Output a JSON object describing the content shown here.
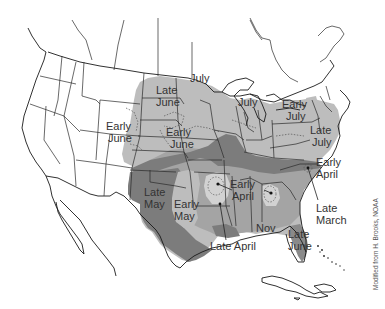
{
  "map": {
    "title": "",
    "region": "Continental United States",
    "credit": "Modified from H. Brooks, NOAA",
    "shading_colors": {
      "light": "#bdbdbd",
      "medium": "#a4a4a4",
      "dark": "#7c7c7c",
      "lightest": "#d8d8d8",
      "land": "#ffffff",
      "outline": "#1a1a1a"
    },
    "labels": [
      {
        "id": "late-june-north",
        "line1": "Late",
        "line2": "June"
      },
      {
        "id": "july-north",
        "line1": "July",
        "line2": ""
      },
      {
        "id": "early-june-west",
        "line1": "Early",
        "line2": "June"
      },
      {
        "id": "early-june-central",
        "line1": "Early",
        "line2": "June"
      },
      {
        "id": "july-michigan",
        "line1": "July",
        "line2": ""
      },
      {
        "id": "early-july-ne",
        "line1": "Early",
        "line2": "July"
      },
      {
        "id": "late-july-east",
        "line1": "Late",
        "line2": "July"
      },
      {
        "id": "early-april-east",
        "line1": "Early",
        "line2": "April"
      },
      {
        "id": "late-march",
        "line1": "Late",
        "line2": "March"
      },
      {
        "id": "late-may",
        "line1": "Late",
        "line2": "May"
      },
      {
        "id": "early-may",
        "line1": "Early",
        "line2": "May"
      },
      {
        "id": "early-april-south",
        "line1": "Early",
        "line2": "April"
      },
      {
        "id": "nov",
        "line1": "Nov",
        "line2": ""
      },
      {
        "id": "late-june-florida",
        "line1": "Late",
        "line2": "June"
      },
      {
        "id": "late-april",
        "line1": "Late April",
        "line2": ""
      }
    ]
  }
}
